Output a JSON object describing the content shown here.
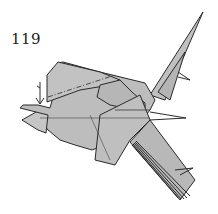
{
  "diagram": {
    "step_number": "119",
    "colors": {
      "paper": "#b8b8b8",
      "paper_light": "#c4c4c4",
      "edge": "#2a2a2a",
      "background": "#ffffff"
    },
    "annotations": [
      {
        "type": "valley-fold-arrow",
        "direction": "down"
      },
      {
        "type": "mountain-fold-line",
        "style": "dash-dot"
      }
    ]
  }
}
